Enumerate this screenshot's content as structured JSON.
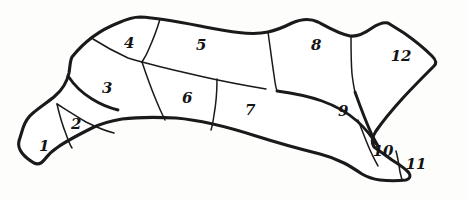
{
  "figure": {
    "kind": "hand-drawn-animal-cuts-diagram",
    "subject_outline_name": "animal-body-outline",
    "background_color": "#fdfdfc",
    "line_color": "#1a1a1a",
    "fill_color": "#ffffff",
    "outline_stroke_width": 3.1,
    "divider_stroke_width": 1.5,
    "region_count": 12
  },
  "regions": [
    {
      "id": 1,
      "label": "1",
      "name": "region-1",
      "x": 44,
      "y": 146
    },
    {
      "id": 2,
      "label": "2",
      "name": "region-2",
      "x": 76,
      "y": 124
    },
    {
      "id": 3,
      "label": "3",
      "name": "region-3",
      "x": 107,
      "y": 88
    },
    {
      "id": 4,
      "label": "4",
      "name": "region-4",
      "x": 129,
      "y": 43
    },
    {
      "id": 5,
      "label": "5",
      "name": "region-5",
      "x": 201,
      "y": 45
    },
    {
      "id": 6,
      "label": "6",
      "name": "region-6",
      "x": 187,
      "y": 98
    },
    {
      "id": 7,
      "label": "7",
      "name": "region-7",
      "x": 250,
      "y": 110
    },
    {
      "id": 8,
      "label": "8",
      "name": "region-8",
      "x": 316,
      "y": 45
    },
    {
      "id": 9,
      "label": "9",
      "name": "region-9",
      "x": 343,
      "y": 111
    },
    {
      "id": 10,
      "label": "10",
      "name": "region-10",
      "x": 383,
      "y": 151
    },
    {
      "id": 11,
      "label": "11",
      "name": "region-11",
      "x": 416,
      "y": 164
    },
    {
      "id": 12,
      "label": "12",
      "name": "region-12",
      "x": 401,
      "y": 56
    }
  ]
}
